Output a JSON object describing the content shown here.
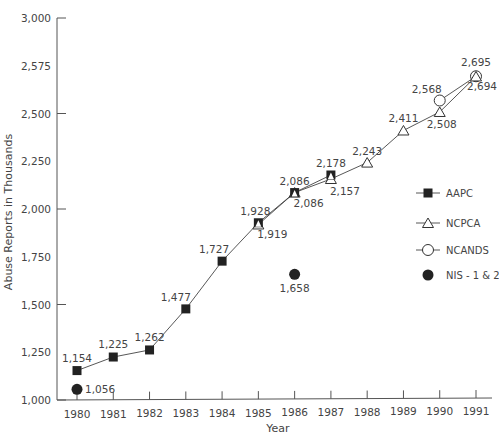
{
  "chart_data": {
    "type": "line",
    "title": "",
    "xlabel": "Year",
    "ylabel": "Abuse Reports in Thousands",
    "x": [
      1980,
      1981,
      1982,
      1983,
      1984,
      1985,
      1986,
      1987,
      1988,
      1989,
      1990,
      1991
    ],
    "x_tick_labels": [
      "1980",
      "1981",
      "1982",
      "1983",
      "1984",
      "1985",
      "1986",
      "1987",
      "1988",
      "1989",
      "1990",
      "1991"
    ],
    "y_tick_labels": [
      "1,000",
      "1,250",
      "1,500",
      "1,750",
      "2,000",
      "2,250",
      "2,500",
      "2,575",
      "3,000"
    ],
    "y_tick_values": [
      1000,
      1250,
      1500,
      1750,
      2000,
      2250,
      2500,
      2750,
      3000
    ],
    "ylim": [
      1000,
      3000
    ],
    "grid": false,
    "legend_position": "right",
    "series": [
      {
        "name": "AAPC",
        "marker": "filled-square",
        "connected": true,
        "points": [
          [
            1980,
            1154
          ],
          [
            1981,
            1225
          ],
          [
            1982,
            1262
          ],
          [
            1983,
            1477
          ],
          [
            1984,
            1727
          ],
          [
            1985,
            1928
          ],
          [
            1986,
            2086
          ],
          [
            1987,
            2178
          ]
        ],
        "labels": [
          "1,154",
          "1,225",
          "1,262",
          "1,477",
          "1,727",
          "1,928",
          "2,086",
          "2,178"
        ]
      },
      {
        "name": "NCPCA",
        "marker": "open-triangle",
        "connected": true,
        "points": [
          [
            1985,
            1919
          ],
          [
            1986,
            2086
          ],
          [
            1987,
            2157
          ],
          [
            1988,
            2243
          ],
          [
            1989,
            2411
          ],
          [
            1990,
            2508
          ],
          [
            1991,
            2694
          ]
        ],
        "labels": [
          "1,919",
          "2,086",
          "2,157",
          "2,243",
          "2,411",
          "2,508",
          "2,694"
        ]
      },
      {
        "name": "NCANDS",
        "marker": "open-circle",
        "connected": true,
        "points": [
          [
            1990,
            2568
          ],
          [
            1991,
            2695
          ]
        ],
        "labels": [
          "2,568",
          "2,695"
        ]
      },
      {
        "name": "NIS - 1 & 2",
        "marker": "filled-circle",
        "connected": false,
        "points": [
          [
            1980,
            1056
          ],
          [
            1986,
            1658
          ]
        ],
        "labels": [
          "1,056",
          "1,658"
        ]
      }
    ]
  },
  "legend": {
    "items": [
      "AAPC",
      "NCPCA",
      "NCANDS",
      "NIS - 1 & 2"
    ]
  }
}
